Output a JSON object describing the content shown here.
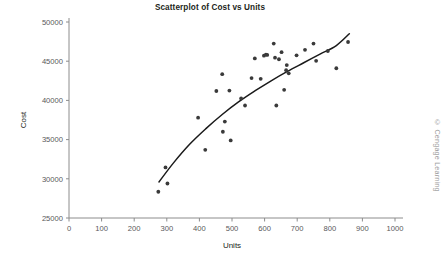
{
  "chart_data": {
    "type": "scatter",
    "title": "Scatterplot of Cost vs Units",
    "xlabel": "Units",
    "ylabel": "Cost",
    "xlim": [
      0,
      1000
    ],
    "ylim": [
      25000,
      50000
    ],
    "xticks": [
      0,
      100,
      200,
      300,
      400,
      500,
      600,
      700,
      800,
      900,
      1000
    ],
    "xtick_labels": [
      "0",
      "100",
      "200",
      "300",
      "400",
      "500",
      "600",
      "700",
      "800",
      "900",
      "1000"
    ],
    "yticks": [
      25000,
      30000,
      35000,
      40000,
      45000,
      50000
    ],
    "ytick_labels": [
      "25000",
      "30000",
      "35000",
      "40000",
      "45000",
      "50000"
    ],
    "grid": false,
    "legend": false,
    "marker_color": "#3a3a3a",
    "curve_color": "#1a1a1a",
    "axis_color": "#8c8c8c",
    "points": [
      {
        "x": 274,
        "y": 28350
      },
      {
        "x": 296,
        "y": 31450
      },
      {
        "x": 302,
        "y": 29400
      },
      {
        "x": 396,
        "y": 37800
      },
      {
        "x": 418,
        "y": 33700
      },
      {
        "x": 452,
        "y": 41200
      },
      {
        "x": 470,
        "y": 43350
      },
      {
        "x": 472,
        "y": 36000
      },
      {
        "x": 478,
        "y": 37300
      },
      {
        "x": 492,
        "y": 41250
      },
      {
        "x": 496,
        "y": 34900
      },
      {
        "x": 528,
        "y": 40250
      },
      {
        "x": 540,
        "y": 39350
      },
      {
        "x": 560,
        "y": 42850
      },
      {
        "x": 570,
        "y": 45350
      },
      {
        "x": 588,
        "y": 42750
      },
      {
        "x": 598,
        "y": 45700
      },
      {
        "x": 604,
        "y": 45850
      },
      {
        "x": 608,
        "y": 45800
      },
      {
        "x": 628,
        "y": 47250
      },
      {
        "x": 632,
        "y": 45450
      },
      {
        "x": 636,
        "y": 39350
      },
      {
        "x": 644,
        "y": 45250
      },
      {
        "x": 652,
        "y": 46150
      },
      {
        "x": 660,
        "y": 41350
      },
      {
        "x": 666,
        "y": 43850
      },
      {
        "x": 668,
        "y": 44500
      },
      {
        "x": 674,
        "y": 43450
      },
      {
        "x": 698,
        "y": 45750
      },
      {
        "x": 724,
        "y": 46450
      },
      {
        "x": 750,
        "y": 47250
      },
      {
        "x": 758,
        "y": 45050
      },
      {
        "x": 794,
        "y": 46300
      },
      {
        "x": 820,
        "y": 44100
      },
      {
        "x": 856,
        "y": 47450
      }
    ],
    "fit_curve": {
      "description": "logarithmic trend line",
      "x_start": 276,
      "x_end": 860,
      "y_start": 29600,
      "y_end": 48500,
      "points": [
        {
          "x": 276,
          "y": 29600
        },
        {
          "x": 320,
          "y": 32000
        },
        {
          "x": 370,
          "y": 34400
        },
        {
          "x": 420,
          "y": 36400
        },
        {
          "x": 470,
          "y": 38200
        },
        {
          "x": 520,
          "y": 39800
        },
        {
          "x": 570,
          "y": 41200
        },
        {
          "x": 620,
          "y": 42500
        },
        {
          "x": 670,
          "y": 43700
        },
        {
          "x": 720,
          "y": 44800
        },
        {
          "x": 770,
          "y": 45900
        },
        {
          "x": 820,
          "y": 47000
        },
        {
          "x": 860,
          "y": 48500
        }
      ]
    }
  },
  "credit": "© Cengage Learning"
}
